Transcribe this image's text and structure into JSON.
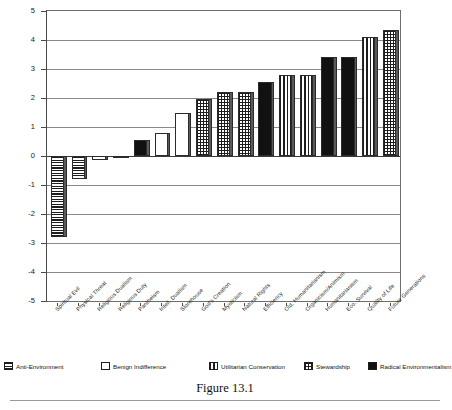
{
  "caption": "Figure 13.1",
  "axis": {
    "y_title": "Agreement",
    "y_ticks": [
      "5",
      "4",
      "3",
      "2",
      "1",
      "0",
      "-1",
      "-2",
      "-3",
      "-4",
      "-5"
    ]
  },
  "legend": {
    "items": [
      {
        "label": "Anti-Environment",
        "pattern": "p-horiz"
      },
      {
        "label": "Benign Indifference",
        "pattern": "p-white"
      },
      {
        "label": "Utilitarian Conservation",
        "pattern": "p-vert"
      },
      {
        "label": "Stewardship",
        "pattern": "p-cross"
      },
      {
        "label": "Radical Environmentalism",
        "pattern": "p-solid"
      }
    ]
  },
  "chart_data": {
    "type": "bar",
    "title": "Figure 13.1",
    "xlabel": "",
    "ylabel": "Agreement",
    "ylim": [
      -5,
      5
    ],
    "grid": true,
    "legend_position": "below",
    "categories": [
      "Spiritual Evil",
      "Physical Threat",
      "Religious Dualism",
      "Religious Duty",
      "Pantheism",
      "Intell. Dualism",
      "Storehouse",
      "God's Creation",
      "Mysticism",
      "Natural Rights",
      "Efficiency",
      "Old. Humanitarianism",
      "Organicism/Animism",
      "Humanitarianism",
      "Eco. Survival",
      "Quality of Life",
      "Future Generations"
    ],
    "values": [
      -2.8,
      -0.8,
      -0.15,
      -0.02,
      0.55,
      0.8,
      1.5,
      1.95,
      2.2,
      2.2,
      2.55,
      2.8,
      2.8,
      3.4,
      3.4,
      4.1,
      4.35
    ],
    "group": [
      "Anti-Environment",
      "Anti-Environment",
      "Benign Indifference",
      "Benign Indifference",
      "Radical Environmentalism",
      "Benign Indifference",
      "Benign Indifference",
      "Stewardship",
      "Stewardship",
      "Stewardship",
      "Radical Environmentalism",
      "Utilitarian Conservation",
      "Utilitarian Conservation",
      "Radical Environmentalism",
      "Radical Environmentalism",
      "Utilitarian Conservation",
      "Stewardship"
    ],
    "patterns": [
      "p-horiz",
      "p-horiz",
      "p-white",
      "p-white",
      "p-solid",
      "p-white",
      "p-white",
      "p-cross",
      "p-cross",
      "p-cross",
      "p-solid",
      "p-vert",
      "p-vert",
      "p-solid",
      "p-solid",
      "p-vert",
      "p-cross"
    ]
  }
}
